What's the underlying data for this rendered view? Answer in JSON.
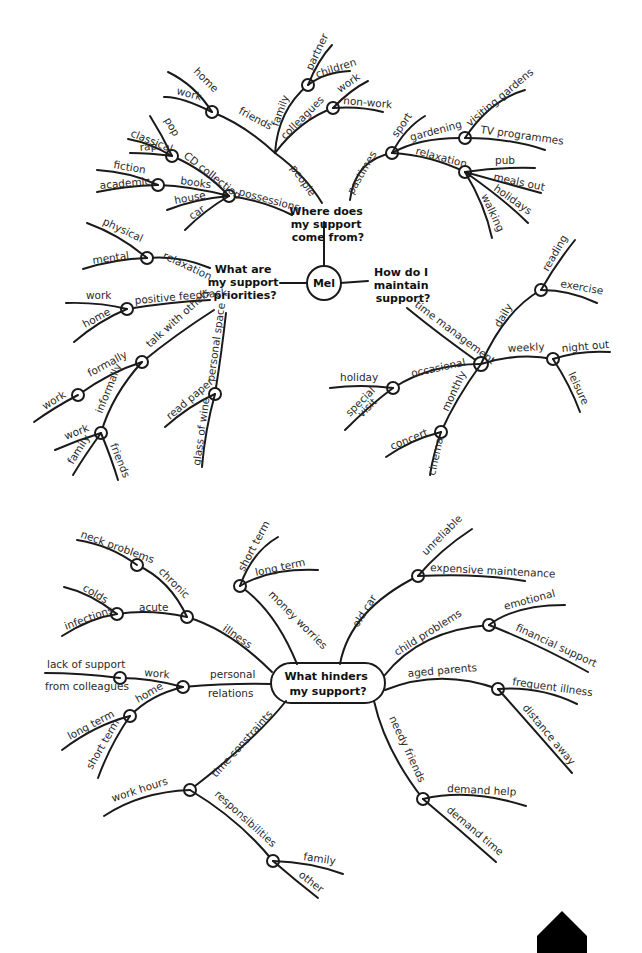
{
  "map1": {
    "center": "Mel",
    "q_where": [
      "Where does",
      "my support",
      "come from?"
    ],
    "q_priorities": [
      "What are",
      "my support",
      "priorities?"
    ],
    "q_maintain": [
      "How do I",
      "maintain",
      "support?"
    ],
    "where": {
      "people": "people",
      "friends": "friends",
      "home": "home",
      "work": "work",
      "family": "family",
      "partner": "partner",
      "children": "children",
      "colleagues": "colleagues",
      "col_work": "work",
      "non_work": "non-work",
      "possessions": "possessions",
      "cd": "CD collection",
      "pop": "pop",
      "classical": "classical",
      "rap": "rap",
      "books": "books",
      "fiction": "fiction",
      "academic": "academic",
      "house": "house",
      "car": "car",
      "pastimes": "pastimes",
      "sport": "sport",
      "gardening": "gardening",
      "visiting": "visiting gardens",
      "tv": "TV programmes",
      "relaxation": "relaxation",
      "pub": "pub",
      "meals": "meals out",
      "holidays": "holidays",
      "walking": "walking"
    },
    "priorities": {
      "relaxation": "relaxation",
      "physical": "physical",
      "mental": "mental",
      "feedback": "positive feedback",
      "fb_work": "work",
      "fb_home": "home",
      "talk": "talk with others",
      "formally": "formally",
      "f_work": "work",
      "informally": "informally",
      "i_work": "work",
      "i_family": "family",
      "i_friends": "friends",
      "space": "personal space",
      "paper": "read paper",
      "wine": "glass of wine"
    },
    "maintain": {
      "time": "time management",
      "daily": "daily",
      "reading": "reading",
      "exercise": "exercise",
      "weekly": "weekly",
      "night": "night out",
      "leisure": "leisure",
      "occasional": "occasional",
      "holiday": "holiday",
      "special": "special",
      "visit": "visit",
      "monthly": "monthly",
      "concert": "concert",
      "cinema": "cinema"
    }
  },
  "map2": {
    "center": [
      "What hinders",
      "my support?"
    ],
    "illness": "illness",
    "chronic": "chronic",
    "neck": "neck problems",
    "acute": "acute",
    "colds": "colds",
    "infections": "infections",
    "money": "money worries",
    "short_term": "short term",
    "long_term": "long term",
    "personal": "personal",
    "relations": "relations",
    "work": "work",
    "lack": "lack of support",
    "from_col": "from colleagues",
    "home": "home",
    "h_long": "long term",
    "h_short": "short term",
    "time": "time constraints",
    "hours": "work hours",
    "resp": "responsibilities",
    "family": "family",
    "other": "other",
    "car": "old car",
    "unreliable": "unreliable",
    "maint": "expensive maintenance",
    "child": "child problems",
    "emotional": "emotional",
    "financial": "financial support",
    "aged": "aged parents",
    "frequent": "frequent illness",
    "distance": "distance away",
    "needy": "needy friends",
    "help": "demand help",
    "demand_time": "demand time"
  }
}
